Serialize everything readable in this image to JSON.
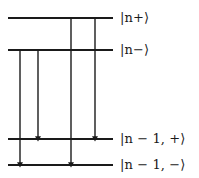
{
  "figure": {
    "type": "energy-level-diagram",
    "title": "",
    "width": 199,
    "height": 178,
    "background_color": "#ffffff",
    "line_color": "#1a1a1a",
    "text_color": "#1a1a1a"
  },
  "levels": [
    {
      "id": "level-n-plus",
      "label": "|n+⟩",
      "y": 18,
      "x_start": 8,
      "x_end": 113,
      "label_x": 120,
      "label_y": 11
    },
    {
      "id": "level-n-minus",
      "label": "|n−⟩",
      "y": 50,
      "x_start": 8,
      "x_end": 113,
      "label_x": 120,
      "label_y": 43
    },
    {
      "id": "level-n-1-plus",
      "label": "|n − 1, +⟩",
      "y": 139,
      "x_start": 8,
      "x_end": 113,
      "label_x": 120,
      "label_y": 132
    },
    {
      "id": "level-n-1-minus",
      "label": "|n − 1, −⟩",
      "y": 165,
      "x_start": 8,
      "x_end": 113,
      "label_x": 120,
      "label_y": 158
    }
  ],
  "transitions": [
    {
      "id": "transition-1",
      "from_level": "level-n-minus",
      "to_level": "level-n-1-minus",
      "x": 20,
      "y_start": 50,
      "y_end": 165
    },
    {
      "id": "transition-2",
      "from_level": "level-n-minus",
      "to_level": "level-n-1-plus",
      "x": 38,
      "y_start": 50,
      "y_end": 139
    },
    {
      "id": "transition-3",
      "from_level": "level-n-plus",
      "to_level": "level-n-1-minus",
      "x": 71,
      "y_start": 18,
      "y_end": 165
    },
    {
      "id": "transition-4",
      "from_level": "level-n-plus",
      "to_level": "level-n-1-plus",
      "x": 95,
      "y_start": 18,
      "y_end": 139
    }
  ]
}
